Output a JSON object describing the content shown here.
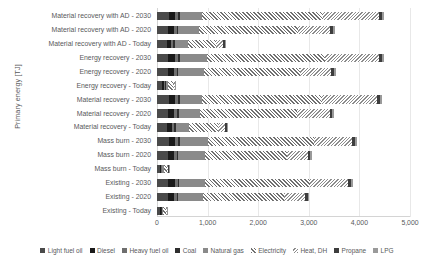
{
  "chart_data": {
    "type": "bar",
    "orientation": "horizontal",
    "stacked": true,
    "title": "",
    "xlabel": "",
    "ylabel": "Primary energy [TJ]",
    "xlim": [
      0,
      5000
    ],
    "xticks": [
      0,
      1000,
      2000,
      3000,
      4000,
      5000
    ],
    "xticklabels": [
      "0",
      "1,000",
      "2,000",
      "3,000",
      "4,000",
      "5,000"
    ],
    "grid": true,
    "grid_axis": "x",
    "legend_position": "bottom",
    "categories": [
      "Material recovery with AD - 2030",
      "Material recovery with AD - 2020",
      "Material recovery with AD - Today",
      "Energy recovery - 2030",
      "Energy recovery - 2020",
      "Energy recovery - Today",
      "Material recovery - 2030",
      "Material recovery - 2020",
      "Material recovery - Today",
      "Mass burn - 2030",
      "Mass burn - 2020",
      "Mass burn - Today",
      "Existing - 2030",
      "Existing - 2020",
      "Existing - Today"
    ],
    "series": [
      {
        "name": "Light fuel oil",
        "key": "light-fuel-oil",
        "values": [
          230,
          215,
          190,
          225,
          215,
          95,
          230,
          220,
          195,
          230,
          215,
          60,
          225,
          215,
          55
        ]
      },
      {
        "name": "Diesel",
        "key": "diesel",
        "values": [
          130,
          120,
          95,
          130,
          120,
          45,
          130,
          125,
          100,
          130,
          120,
          25,
          125,
          120,
          22
        ]
      },
      {
        "name": "Heavy fuel oil",
        "key": "heavy-fuel-oil",
        "values": [
          60,
          55,
          40,
          60,
          55,
          20,
          60,
          55,
          45,
          60,
          55,
          12,
          58,
          55,
          10
        ]
      },
      {
        "name": "Coal",
        "key": "coal",
        "values": [
          35,
          32,
          25,
          35,
          32,
          12,
          35,
          33,
          26,
          35,
          32,
          8,
          34,
          32,
          7
        ]
      },
      {
        "name": "Natural gas",
        "key": "natural-gas",
        "values": [
          430,
          405,
          260,
          530,
          505,
          45,
          430,
          410,
          265,
          545,
          520,
          35,
          510,
          495,
          30
        ]
      },
      {
        "name": "Electricity",
        "key": "electricity",
        "values": [
          2400,
          1950,
          560,
          2350,
          1900,
          95,
          2380,
          1930,
          575,
          2100,
          1620,
          60,
          2080,
          1600,
          55
        ]
      },
      {
        "name": "Heat, DH",
        "key": "heat-dh",
        "values": [
          1100,
          650,
          135,
          1060,
          620,
          38,
          1080,
          640,
          140,
          760,
          420,
          22,
          740,
          410,
          20
        ]
      },
      {
        "name": "Propane",
        "key": "propane",
        "values": [
          55,
          50,
          35,
          55,
          50,
          14,
          55,
          52,
          36,
          55,
          50,
          9,
          54,
          50,
          8
        ]
      },
      {
        "name": "LPG",
        "key": "lpg",
        "values": [
          40,
          36,
          26,
          40,
          36,
          10,
          40,
          37,
          27,
          40,
          36,
          6,
          39,
          36,
          5
        ]
      }
    ],
    "totals": [
      4480,
      3513,
      1366,
      4485,
      3433,
      374,
      4440,
      3502,
      1409,
      3955,
      3068,
      237,
      3865,
      3013,
      212
    ]
  },
  "legend": {
    "items": [
      {
        "label": "Light fuel oil",
        "key": "light-fuel-oil"
      },
      {
        "label": "Diesel",
        "key": "diesel"
      },
      {
        "label": "Heavy fuel oil",
        "key": "heavy-fuel-oil"
      },
      {
        "label": "Coal",
        "key": "coal"
      },
      {
        "label": "Natural gas",
        "key": "natural-gas"
      },
      {
        "label": "Electricity",
        "key": "electricity"
      },
      {
        "label": "Heat, DH",
        "key": "heat-dh"
      },
      {
        "label": "Propane",
        "key": "propane"
      },
      {
        "label": "LPG",
        "key": "lpg"
      }
    ]
  }
}
